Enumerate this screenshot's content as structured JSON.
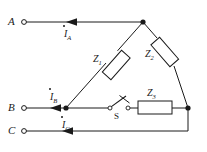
{
  "diagram": {
    "background_color": "#ffffff",
    "line_color": "#1a1a1a",
    "text_color": "#1a1a1a"
  },
  "terminals": [
    {
      "id": "A",
      "label": "A",
      "x": 22,
      "y": 22,
      "marker": "open-circle"
    },
    {
      "id": "B",
      "label": "B",
      "x": 22,
      "y": 108,
      "marker": "open-circle"
    },
    {
      "id": "C",
      "label": "C",
      "x": 22,
      "y": 131,
      "marker": "open-circle"
    }
  ],
  "currents": [
    {
      "id": "IA",
      "symbol": "I",
      "subscript": "A",
      "phasor_dot": true,
      "line": "A"
    },
    {
      "id": "IB",
      "symbol": "I",
      "subscript": "B",
      "phasor_dot": true,
      "line": "B"
    },
    {
      "id": "IC",
      "symbol": "I",
      "subscript": "C",
      "phasor_dot": true,
      "line": "C"
    }
  ],
  "impedances": [
    {
      "id": "Z1",
      "symbol": "Z",
      "subscript": "1",
      "orientation": "diagonal-left",
      "between": [
        "top-node",
        "b-node"
      ]
    },
    {
      "id": "Z2",
      "symbol": "Z",
      "subscript": "2",
      "orientation": "diagonal-right",
      "between": [
        "top-node",
        "right-node"
      ]
    },
    {
      "id": "Z3",
      "symbol": "Z",
      "subscript": "3",
      "orientation": "horizontal",
      "between": [
        "switch",
        "right-node"
      ]
    }
  ],
  "switch": {
    "id": "S",
    "label": "S",
    "state": "open",
    "type": "knife-switch"
  },
  "nodes": [
    {
      "id": "top-node",
      "x": 143,
      "y": 22,
      "filled": true
    },
    {
      "id": "b-node",
      "x": 66,
      "y": 108,
      "filled": true
    },
    {
      "id": "right-node",
      "x": 188,
      "y": 108,
      "filled": true
    }
  ]
}
